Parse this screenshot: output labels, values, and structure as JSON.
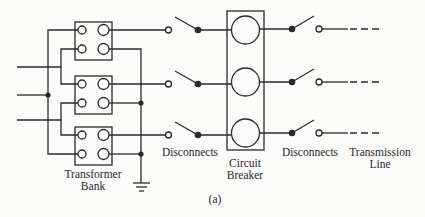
{
  "diagram": {
    "type": "one-line electrical schematic",
    "caption": "(a)",
    "labels": {
      "transformer_bank_line1": "Transformer",
      "transformer_bank_line2": "Bank",
      "disconnects_left": "Disconnects",
      "circuit_breaker_line1": "Circuit",
      "circuit_breaker_line2": "Breaker",
      "disconnects_right": "Disconnects",
      "transmission_line_line1": "Transmission",
      "transmission_line_line2": "Line"
    },
    "components": [
      {
        "id": "transformer-1",
        "kind": "transformer",
        "phase": 1
      },
      {
        "id": "transformer-2",
        "kind": "transformer",
        "phase": 2
      },
      {
        "id": "transformer-3",
        "kind": "transformer",
        "phase": 3
      },
      {
        "id": "ground",
        "kind": "ground"
      },
      {
        "id": "disconnect-left-1",
        "kind": "disconnect-switch",
        "state": "open"
      },
      {
        "id": "disconnect-left-2",
        "kind": "disconnect-switch",
        "state": "open"
      },
      {
        "id": "disconnect-left-3",
        "kind": "disconnect-switch",
        "state": "open"
      },
      {
        "id": "circuit-breaker",
        "kind": "circuit-breaker",
        "poles": 3
      },
      {
        "id": "disconnect-right-1",
        "kind": "disconnect-switch",
        "state": "open"
      },
      {
        "id": "disconnect-right-2",
        "kind": "disconnect-switch",
        "state": "open"
      },
      {
        "id": "disconnect-right-3",
        "kind": "disconnect-switch",
        "state": "open"
      },
      {
        "id": "transmission-line",
        "kind": "line",
        "phases": 3
      }
    ],
    "colors": {
      "ink": "#2a2a2a",
      "background": "#fbfbfa"
    }
  }
}
